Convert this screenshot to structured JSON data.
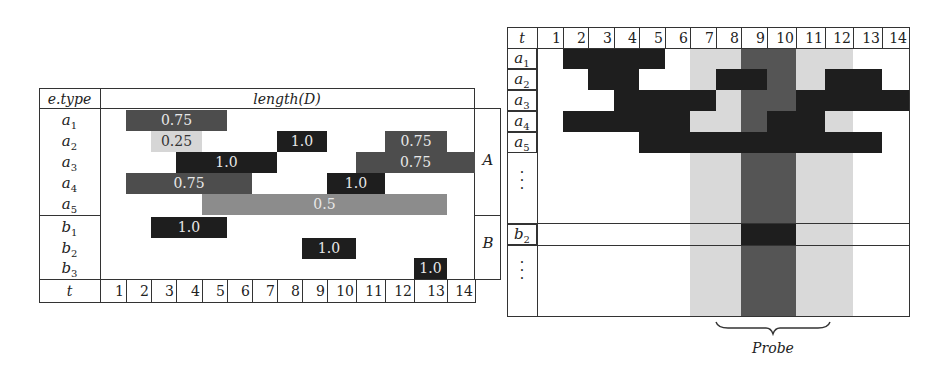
{
  "left_table": {
    "header_label": "e.type",
    "header_title": "length(D)",
    "group_labels": [
      "A",
      "B"
    ],
    "time_label": "t",
    "time_ticks": [
      "1",
      "2",
      "3",
      "4",
      "5",
      "6",
      "7",
      "8",
      "9",
      "10",
      "11",
      "12",
      "13",
      "14"
    ],
    "rows": [
      {
        "base": "a",
        "sub": "1",
        "bars": [
          {
            "value": "0.75",
            "start": 2,
            "end": 5,
            "shade": "dark"
          }
        ]
      },
      {
        "base": "a",
        "sub": "2",
        "bars": [
          {
            "value": "0.25",
            "start": 3,
            "end": 4,
            "shade": "light"
          },
          {
            "value": "1.0",
            "start": 8,
            "end": 9,
            "shade": "black"
          },
          {
            "value": "0.75",
            "start": 12,
            "end": 13,
            "shade": "dark"
          }
        ]
      },
      {
        "base": "a",
        "sub": "3",
        "bars": [
          {
            "value": "1.0",
            "start": 4,
            "end": 7,
            "shade": "black"
          },
          {
            "value": "0.75",
            "start": 11,
            "end": 14,
            "shade": "dark"
          }
        ]
      },
      {
        "base": "a",
        "sub": "4",
        "bars": [
          {
            "value": "0.75",
            "start": 2,
            "end": 6,
            "shade": "dark"
          },
          {
            "value": "1.0",
            "start": 10,
            "end": 11,
            "shade": "black"
          }
        ]
      },
      {
        "base": "a",
        "sub": "5",
        "bars": [
          {
            "value": "0.5",
            "start": 5,
            "end": 13,
            "shade": "mid"
          }
        ]
      },
      {
        "base": "b",
        "sub": "1",
        "bars": [
          {
            "value": "1.0",
            "start": 3,
            "end": 5,
            "shade": "black"
          }
        ]
      },
      {
        "base": "b",
        "sub": "2",
        "bars": [
          {
            "value": "1.0",
            "start": 9,
            "end": 10,
            "shade": "black"
          }
        ]
      },
      {
        "base": "b",
        "sub": "3",
        "bars": [
          {
            "value": "1.0",
            "start": 13,
            "end": 13,
            "shade": "black"
          }
        ]
      }
    ]
  },
  "right_table": {
    "time_label": "t",
    "time_ticks": [
      "1",
      "2",
      "3",
      "4",
      "5",
      "6",
      "7",
      "8",
      "9",
      "10",
      "11",
      "12",
      "13",
      "14"
    ],
    "rows": [
      {
        "base": "a",
        "sub": "1",
        "segments": [
          [
            2,
            5
          ]
        ]
      },
      {
        "base": "a",
        "sub": "2",
        "segments": [
          [
            3,
            4
          ],
          [
            8,
            9
          ],
          [
            12,
            13
          ]
        ]
      },
      {
        "base": "a",
        "sub": "3",
        "segments": [
          [
            4,
            7
          ],
          [
            11,
            14
          ]
        ]
      },
      {
        "base": "a",
        "sub": "4",
        "segments": [
          [
            2,
            6
          ],
          [
            10,
            11
          ]
        ]
      },
      {
        "base": "a",
        "sub": "5",
        "segments": [
          [
            5,
            13
          ]
        ]
      },
      {
        "base": "b",
        "sub": "2",
        "segments": [
          [
            9,
            10
          ]
        ]
      }
    ],
    "ellipsis": "⋮",
    "context_window": [
      7,
      12
    ],
    "probe_window": [
      9,
      10
    ],
    "probe_label": "Probe"
  },
  "colors": {
    "black": "#1e1e1e",
    "dark": "#4d4d4d",
    "mid": "#8c8c8c",
    "light": "#d6d6d6",
    "band_light": "#d9d9d9",
    "band_dark": "#555555"
  }
}
